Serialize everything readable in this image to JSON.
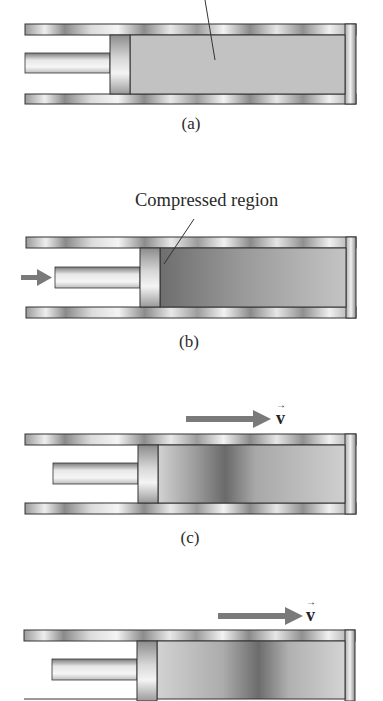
{
  "figure": {
    "panels": [
      {
        "id": "a",
        "label": "(a)",
        "state": "uniform-gas",
        "callout": ""
      },
      {
        "id": "b",
        "label": "(b)",
        "state": "compressed",
        "callout": "Compressed region",
        "push_arrow": true
      },
      {
        "id": "c",
        "label": "(c)",
        "state": "pulse-traveling",
        "velocity_label": "v"
      },
      {
        "id": "d",
        "label": "",
        "state": "pulse-traveling-further",
        "velocity_label": "v"
      }
    ]
  },
  "colors": {
    "wall_dark": "#6e6e6e",
    "wall_light": "#f2f2f2",
    "gas": "#c2c2c2",
    "gas_compressed": "#7e7e7e",
    "pulse_dark": "#6a6a6a",
    "arrow": "#7a7a7a",
    "outline": "#333333"
  }
}
